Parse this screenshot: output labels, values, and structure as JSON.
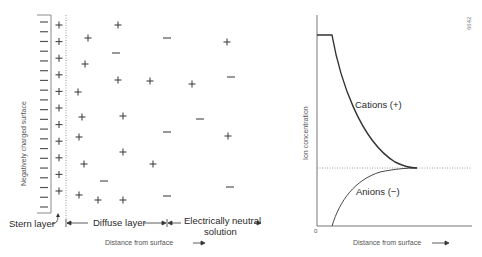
{
  "figure_id": "6642",
  "left_panel": {
    "surface_label": "Negatively charged surface",
    "stern_layer_label": "Stern layer",
    "diffuse_layer_label": "Diffuse layer",
    "neutral_solution_label_line1": "Electrically neutral",
    "neutral_solution_label_line2": "solution",
    "x_axis_label": "Distance from surface",
    "surface_charges": {
      "symbol": "−",
      "count": 20
    },
    "stern_cations": {
      "symbol": "+",
      "count": 11
    },
    "diffuse_ions": [
      {
        "sign": "+",
        "x": 88,
        "y": 38
      },
      {
        "sign": "+",
        "x": 118,
        "y": 25
      },
      {
        "sign": "−",
        "x": 116,
        "y": 53
      },
      {
        "sign": "+",
        "x": 85,
        "y": 64
      },
      {
        "sign": "+",
        "x": 118,
        "y": 80
      },
      {
        "sign": "+",
        "x": 150,
        "y": 81
      },
      {
        "sign": "+",
        "x": 78,
        "y": 92
      },
      {
        "sign": "+",
        "x": 82,
        "y": 117
      },
      {
        "sign": "+",
        "x": 123,
        "y": 116
      },
      {
        "sign": "+",
        "x": 79,
        "y": 137
      },
      {
        "sign": "+",
        "x": 123,
        "y": 152
      },
      {
        "sign": "+",
        "x": 84,
        "y": 164
      },
      {
        "sign": "+",
        "x": 153,
        "y": 164
      },
      {
        "sign": "−",
        "x": 104,
        "y": 181
      },
      {
        "sign": "+",
        "x": 79,
        "y": 195
      },
      {
        "sign": "+",
        "x": 98,
        "y": 200
      },
      {
        "sign": "+",
        "x": 123,
        "y": 200
      },
      {
        "sign": "−",
        "x": 167,
        "y": 38
      },
      {
        "sign": "−",
        "x": 167,
        "y": 132
      },
      {
        "sign": "−",
        "x": 167,
        "y": 196
      },
      {
        "sign": "+",
        "x": 227,
        "y": 42
      },
      {
        "sign": "−",
        "x": 231,
        "y": 77
      },
      {
        "sign": "+",
        "x": 192,
        "y": 84
      },
      {
        "sign": "−",
        "x": 200,
        "y": 119
      },
      {
        "sign": "+",
        "x": 228,
        "y": 136
      },
      {
        "sign": "−",
        "x": 230,
        "y": 187
      }
    ]
  },
  "right_panel": {
    "y_axis_label": "Ion concentration",
    "x_axis_label": "Distance from surface",
    "origin_label": "0",
    "cations_label": "Cations (+)",
    "anions_label": "Anions (−)"
  },
  "chart_data": {
    "type": "line",
    "title": "",
    "xlabel": "Distance from surface",
    "ylabel": "Ion concentration",
    "series": [
      {
        "name": "Cations (+)",
        "style": "solid",
        "x": [
          0,
          0.1,
          0.25,
          0.5,
          0.75,
          1.0
        ],
        "y": [
          1.0,
          1.0,
          0.72,
          0.42,
          0.31,
          0.3
        ]
      },
      {
        "name": "Anions (−)",
        "style": "dashed",
        "x": [
          0.1,
          0.25,
          0.5,
          0.75,
          1.0
        ],
        "y": [
          0.0,
          0.13,
          0.23,
          0.28,
          0.3
        ]
      },
      {
        "name": "Bulk concentration",
        "style": "dotted",
        "x": [
          0,
          1.5
        ],
        "y": [
          0.3,
          0.3
        ]
      }
    ],
    "grid": false
  },
  "colors": {
    "line": "#333333",
    "surface": "#888888",
    "dotted": "#999999"
  }
}
